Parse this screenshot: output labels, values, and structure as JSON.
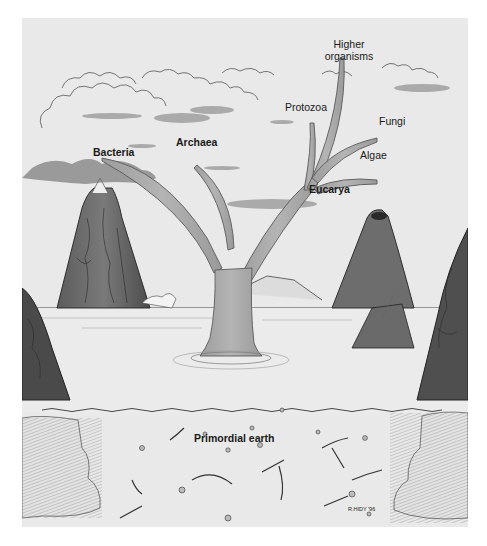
{
  "figure": {
    "labels": {
      "higher_organisms_line1": "Higher",
      "higher_organisms_line2": "organisms",
      "protozoa": "Protozoa",
      "fungi": "Fungi",
      "algae": "Algae",
      "eucarya": "Eucarya",
      "archaea": "Archaea",
      "bacteria": "Bacteria",
      "primordial_earth": "Primordial earth"
    },
    "domains": [
      "Bacteria",
      "Archaea",
      "Eucarya"
    ],
    "eucarya_branches": [
      "Protozoa",
      "Higher organisms",
      "Fungi",
      "Algae"
    ],
    "signature": "R.HIDY '96",
    "colors": {
      "panel_background": "#e9e9e9",
      "tree_fill": "#a9a9a9",
      "tree_stroke": "#5a5a5a",
      "rock_dark": "#4a4a4a",
      "rock_mid": "#777777",
      "line_ink": "#333333",
      "water": "#ebebeb"
    }
  }
}
